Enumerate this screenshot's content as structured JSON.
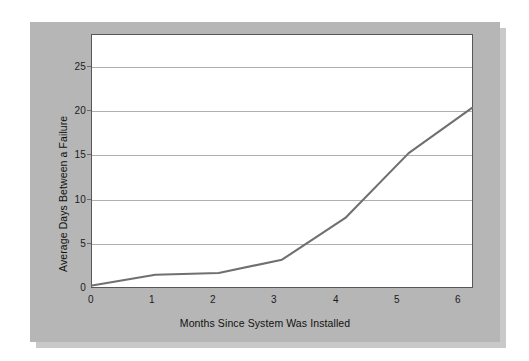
{
  "figure": {
    "background_color": "#ffffff",
    "panel_color": "#b6b6b6",
    "plot_area_color": "#ffffff",
    "frame_color": "#55575a",
    "gridline_color": "#b0b0b0",
    "line_color": "#707070"
  },
  "chart_data": {
    "type": "line",
    "title": "",
    "xlabel": "Months Since System Was Installed",
    "ylabel": "Average Days Between a Failure",
    "x": [
      0,
      1,
      2,
      3,
      4,
      5,
      6
    ],
    "values": [
      0.4,
      1.6,
      1.8,
      3.3,
      8.0,
      15.3,
      20.4
    ],
    "series": [
      {
        "name": "Average Days Between a Failure",
        "values": [
          0.4,
          1.6,
          1.8,
          3.3,
          8.0,
          15.3,
          20.4
        ]
      }
    ],
    "xticks": [
      "0",
      "1",
      "2",
      "3",
      "4",
      "5",
      "6"
    ],
    "yticks": [
      "0",
      "5",
      "10",
      "15",
      "20",
      "25"
    ],
    "ytick_values": [
      0,
      5,
      10,
      15,
      20,
      25
    ],
    "xlim": [
      0,
      6
    ],
    "ylim": [
      0,
      28.6
    ],
    "grid": "horizontal",
    "legend": "none"
  }
}
